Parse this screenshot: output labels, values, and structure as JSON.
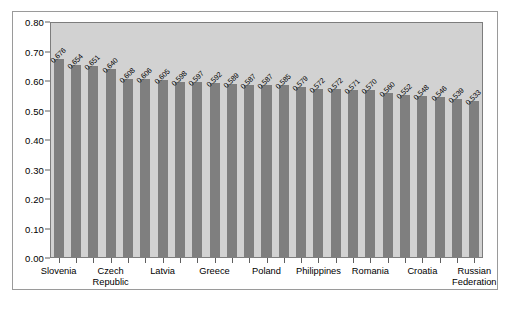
{
  "chart_data": {
    "type": "bar",
    "title": "",
    "subtitle": "",
    "xlabel": "",
    "ylabel": "",
    "ylim": [
      0.0,
      0.8
    ],
    "grid": false,
    "legend": false,
    "orientation": "vertical",
    "bar_color": "#7f7f7f",
    "plot_background": "#d2d2d2",
    "figure_background": "#ffffff",
    "value_label_rotation": -45,
    "y_ticks": [
      "0.00",
      "0.10",
      "0.20",
      "0.30",
      "0.40",
      "0.50",
      "0.60",
      "0.70",
      "0.80"
    ],
    "y_tick_values": [
      0.0,
      0.1,
      0.2,
      0.3,
      0.4,
      0.5,
      0.6,
      0.7,
      0.8
    ],
    "categories": [
      "Slovenia",
      "",
      "",
      "Czech Republic",
      "",
      "",
      "Latvia",
      "",
      "",
      "Greece",
      "",
      "",
      "Poland",
      "",
      "",
      "Philippines",
      "",
      "",
      "Romania",
      "",
      "",
      "Croatia",
      "",
      "",
      "Russian Federation"
    ],
    "visible_x_tick_labels": [
      {
        "index": 0,
        "label": "Slovenia",
        "lines": [
          "Slovenia"
        ]
      },
      {
        "index": 3,
        "label": "Czech Republic",
        "lines": [
          "Czech",
          "Republic"
        ]
      },
      {
        "index": 6,
        "label": "Latvia",
        "lines": [
          "Latvia"
        ]
      },
      {
        "index": 9,
        "label": "Greece",
        "lines": [
          "Greece"
        ]
      },
      {
        "index": 12,
        "label": "Poland",
        "lines": [
          "Poland"
        ]
      },
      {
        "index": 15,
        "label": "Philippines",
        "lines": [
          "Philippines"
        ]
      },
      {
        "index": 18,
        "label": "Romania",
        "lines": [
          "Romania"
        ]
      },
      {
        "index": 21,
        "label": "Croatia",
        "lines": [
          "Croatia"
        ]
      },
      {
        "index": 24,
        "label": "Russian Federation",
        "lines": [
          "Russian",
          "Federation"
        ]
      }
    ],
    "values": [
      0.676,
      0.654,
      0.651,
      0.64,
      0.608,
      0.606,
      0.605,
      0.598,
      0.597,
      0.592,
      0.589,
      0.587,
      0.587,
      0.585,
      0.579,
      0.572,
      0.572,
      0.571,
      0.57,
      0.56,
      0.552,
      0.548,
      0.546,
      0.539,
      0.533
    ],
    "value_labels": [
      "0.676",
      "0.654",
      "0.651",
      "0.640",
      "0.608",
      "0.606",
      "0.605",
      "0.598",
      "0.597",
      "0.592",
      "0.589",
      "0.587",
      "0.587",
      "0.585",
      "0.579",
      "0.572",
      "0.572",
      "0.571",
      "0.570",
      "0.560",
      "0.552",
      "0.548",
      "0.546",
      "0.539",
      "0.533"
    ]
  }
}
